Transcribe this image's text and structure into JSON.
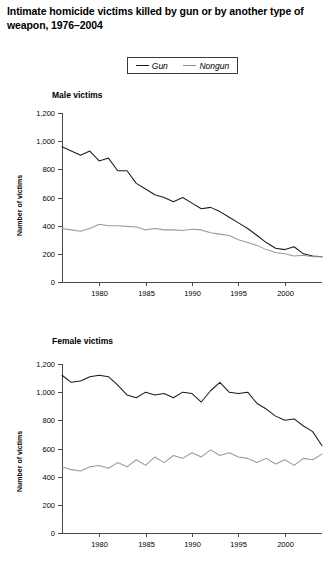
{
  "figure": {
    "title": "Intimate homicide victims killed by gun or by another type of weapon, 1976–2004"
  },
  "legend": {
    "position": "top-center",
    "entries": [
      {
        "label": "Gun",
        "color": "#1c1c1c"
      },
      {
        "label": "Nongun",
        "color": "#9a9a9a"
      }
    ]
  },
  "chart_data": [
    {
      "type": "line",
      "title": "Male victims",
      "xlabel": "",
      "ylabel": "Number of victims",
      "xlim": [
        1976,
        2004
      ],
      "ylim": [
        0,
        1200
      ],
      "yticks": [
        0,
        200,
        400,
        600,
        800,
        1000,
        1200
      ],
      "ytick_labels": [
        "0",
        "200",
        "400",
        "600",
        "800",
        "1,000",
        "1,200"
      ],
      "xticks": [
        1980,
        1985,
        1990,
        1995,
        2000
      ],
      "xtick_labels": [
        "1980",
        "1985",
        "1990",
        "1995",
        "2000"
      ],
      "grid": false,
      "x": [
        1976,
        1977,
        1978,
        1979,
        1980,
        1981,
        1982,
        1983,
        1984,
        1985,
        1986,
        1987,
        1988,
        1989,
        1990,
        1991,
        1992,
        1993,
        1994,
        1995,
        1996,
        1997,
        1998,
        1999,
        2000,
        2001,
        2002,
        2003,
        2004
      ],
      "series": [
        {
          "name": "Gun",
          "color": "#1c1c1c",
          "values": [
            960,
            930,
            900,
            930,
            860,
            880,
            790,
            790,
            700,
            660,
            620,
            600,
            570,
            600,
            560,
            520,
            530,
            500,
            460,
            420,
            380,
            330,
            280,
            240,
            230,
            250,
            200,
            185,
            180
          ]
        },
        {
          "name": "Nongun",
          "color": "#9a9a9a",
          "values": [
            380,
            370,
            360,
            380,
            410,
            400,
            400,
            395,
            390,
            370,
            380,
            370,
            370,
            365,
            375,
            370,
            350,
            340,
            330,
            300,
            280,
            260,
            230,
            210,
            200,
            185,
            190,
            180,
            180
          ]
        }
      ]
    },
    {
      "type": "line",
      "title": "Female victims",
      "xlabel": "",
      "ylabel": "Number of victims",
      "xlim": [
        1976,
        2004
      ],
      "ylim": [
        0,
        1200
      ],
      "yticks": [
        0,
        200,
        400,
        600,
        800,
        1000,
        1200
      ],
      "ytick_labels": [
        "0",
        "200",
        "400",
        "600",
        "800",
        "1,000",
        "1,200"
      ],
      "xticks": [
        1980,
        1985,
        1990,
        1995,
        2000
      ],
      "xtick_labels": [
        "1980",
        "1985",
        "1990",
        "1995",
        "2000"
      ],
      "grid": false,
      "x": [
        1976,
        1977,
        1978,
        1979,
        1980,
        1981,
        1982,
        1983,
        1984,
        1985,
        1986,
        1987,
        1988,
        1989,
        1990,
        1991,
        1992,
        1993,
        1994,
        1995,
        1996,
        1997,
        1998,
        1999,
        2000,
        2001,
        2002,
        2003,
        2004
      ],
      "series": [
        {
          "name": "Gun",
          "color": "#1c1c1c",
          "values": [
            1120,
            1070,
            1080,
            1110,
            1120,
            1110,
            1050,
            980,
            960,
            1000,
            980,
            990,
            960,
            1000,
            990,
            930,
            1010,
            1070,
            1000,
            990,
            1000,
            920,
            880,
            830,
            800,
            810,
            760,
            720,
            620
          ]
        },
        {
          "name": "Nongun",
          "color": "#9a9a9a",
          "values": [
            470,
            450,
            440,
            470,
            480,
            460,
            500,
            470,
            520,
            480,
            540,
            500,
            550,
            530,
            570,
            540,
            590,
            550,
            570,
            540,
            530,
            500,
            530,
            490,
            520,
            480,
            530,
            520,
            560
          ]
        }
      ]
    }
  ]
}
